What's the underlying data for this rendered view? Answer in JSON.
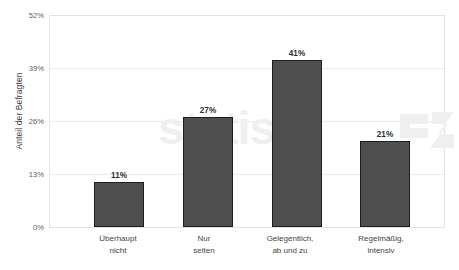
{
  "chart_data": {
    "type": "bar",
    "title": "",
    "subtitle": "",
    "xlabel": "",
    "ylabel": "Anteil der Befragten",
    "categories": [
      "Überhaupt\nnicht",
      "Nur\nselten",
      "Gelegentlich,\nab und zu",
      "Regelmäßig,\nintensiv"
    ],
    "values": [
      11,
      27,
      41,
      21
    ],
    "value_labels": [
      "11%",
      "27%",
      "41%",
      "21%"
    ],
    "ylim": [
      0,
      52
    ],
    "yticks": [
      0,
      13,
      26,
      39,
      52
    ],
    "ytick_labels": [
      "0%",
      "13%",
      "26%",
      "39%",
      "52%"
    ],
    "grid": true,
    "legend": false,
    "bar_color": "#4f4f4f",
    "bar_border_color": "#1d1d1d",
    "gridline_color": "#ececec",
    "frame_color": "#e2e2e2"
  },
  "watermark": {
    "text": "statista",
    "color": "#f0eeee"
  }
}
